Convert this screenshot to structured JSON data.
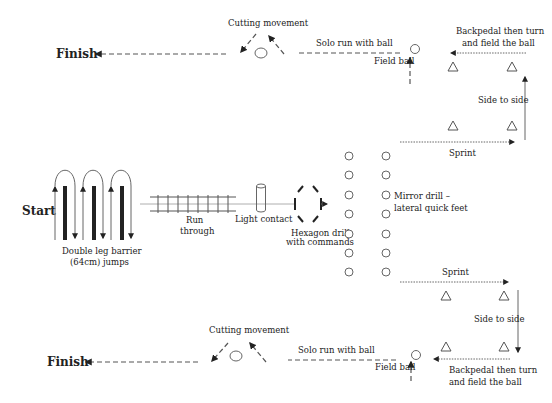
{
  "diagram": {
    "start_label": "Start",
    "finish_top_label": "Finish",
    "finish_bottom_label": "Finish",
    "stations": {
      "barrier_jumps": {
        "label_line1": "Double leg barrier",
        "label_line2": "(64cm) jumps",
        "barrier_count": 3
      },
      "ladder": {
        "label_line1": "Run",
        "label_line2": "through",
        "rungs": 8
      },
      "contact_pad": {
        "label": "Light contact"
      },
      "hexagon": {
        "label_line1": "Hexagon drill",
        "label_line2": "with commands"
      },
      "mirror_drill": {
        "label_line1": "Mirror drill –",
        "label_line2": "lateral quick feet",
        "cone_columns": 2,
        "cones_per_column": 7
      }
    },
    "top_route": {
      "sprint_label": "Sprint",
      "side_to_side_label": "Side to side",
      "backpedal_label_line1": "Backpedal then turn",
      "backpedal_label_line2": "and field the ball",
      "field_ball_label": "Field ball",
      "solo_run_label": "Solo run with ball",
      "cutting_label": "Cutting movement"
    },
    "bottom_route": {
      "sprint_label": "Sprint",
      "side_to_side_label": "Side to side",
      "backpedal_label_line1": "Backpedal then turn",
      "backpedal_label_line2": "and field the ball",
      "field_ball_label": "Field ball",
      "solo_run_label": "Solo run with ball",
      "cutting_label": "Cutting movement"
    },
    "colors": {
      "ink": "#222222",
      "line": "#555555",
      "background": "#ffffff"
    }
  }
}
